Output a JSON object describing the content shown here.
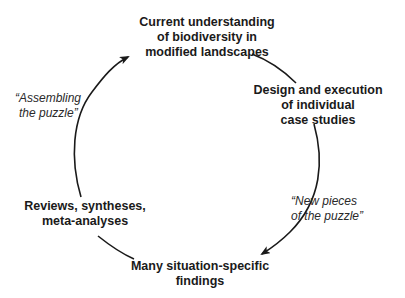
{
  "diagram": {
    "type": "cycle",
    "nodes": [
      {
        "id": "current-understanding",
        "lines": [
          "Current understanding",
          "of biodiversity in",
          "modified landscapes"
        ]
      },
      {
        "id": "case-studies",
        "lines": [
          "Design and execution",
          "of individual",
          "case studies"
        ]
      },
      {
        "id": "findings",
        "lines": [
          "Many situation-specific",
          "findings"
        ]
      },
      {
        "id": "reviews",
        "lines": [
          "Reviews, syntheses,",
          "meta-analyses"
        ]
      }
    ],
    "edge_labels": [
      {
        "id": "new-pieces",
        "lines": [
          "“New pieces",
          "of the puzzle”"
        ]
      },
      {
        "id": "assembling",
        "lines": [
          "“Assembling",
          "the puzzle”"
        ]
      }
    ],
    "edges": [
      {
        "from": "current-understanding",
        "to": "case-studies",
        "arrowhead": false
      },
      {
        "from": "case-studies",
        "to": "findings",
        "arrowhead": true,
        "label": "new-pieces"
      },
      {
        "from": "findings",
        "to": "reviews",
        "arrowhead": false
      },
      {
        "from": "reviews",
        "to": "current-understanding",
        "arrowhead": true,
        "label": "assembling"
      }
    ],
    "colors": {
      "text": "#1a1a1a",
      "line": "#1a1a1a",
      "background": "#ffffff"
    }
  }
}
